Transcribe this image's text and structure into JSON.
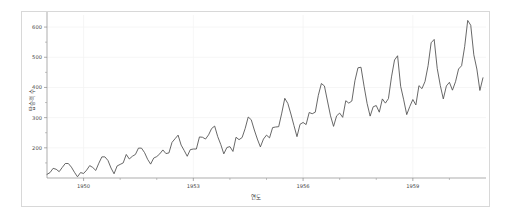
{
  "figure": {
    "background_color": "#ffffff",
    "panel_border_color": "#d8d8d8",
    "axis_color": "#8a8a8a",
    "grid_color": "#f4f4f4"
  },
  "chart_data": {
    "type": "line",
    "title": "",
    "subtitle": "",
    "xlabel": "연도",
    "ylabel": "탑승객 수",
    "line_color": "#4d4d4d",
    "grid": true,
    "legend": false,
    "legend_position": "none",
    "xlim": [
      1949.0,
      1961.0
    ],
    "ylim": [
      100,
      640
    ],
    "x_ticks": [
      1950,
      1953,
      1956,
      1959
    ],
    "x_tick_labels": [
      "1950",
      "1953",
      "1956",
      "1959"
    ],
    "x_minor_ticks": [
      1951,
      1952,
      1954,
      1955,
      1957,
      1958,
      1960
    ],
    "y_ticks": [
      200,
      300,
      400,
      500,
      600
    ],
    "y_tick_labels": [
      "200",
      "300",
      "400",
      "500",
      "600"
    ],
    "y_minor_ticks": [
      150,
      250,
      350,
      450,
      550
    ],
    "series": [
      {
        "name": "AirPassengers",
        "x": [
          1949.0,
          1949.083,
          1949.167,
          1949.25,
          1949.333,
          1949.417,
          1949.5,
          1949.583,
          1949.667,
          1949.75,
          1949.833,
          1949.917,
          1950.0,
          1950.083,
          1950.167,
          1950.25,
          1950.333,
          1950.417,
          1950.5,
          1950.583,
          1950.667,
          1950.75,
          1950.833,
          1950.917,
          1951.0,
          1951.083,
          1951.167,
          1951.25,
          1951.333,
          1951.417,
          1951.5,
          1951.583,
          1951.667,
          1951.75,
          1951.833,
          1951.917,
          1952.0,
          1952.083,
          1952.167,
          1952.25,
          1952.333,
          1952.417,
          1952.5,
          1952.583,
          1952.667,
          1952.75,
          1952.833,
          1952.917,
          1953.0,
          1953.083,
          1953.167,
          1953.25,
          1953.333,
          1953.417,
          1953.5,
          1953.583,
          1953.667,
          1953.75,
          1953.833,
          1953.917,
          1954.0,
          1954.083,
          1954.167,
          1954.25,
          1954.333,
          1954.417,
          1954.5,
          1954.583,
          1954.667,
          1954.75,
          1954.833,
          1954.917,
          1955.0,
          1955.083,
          1955.167,
          1955.25,
          1955.333,
          1955.417,
          1955.5,
          1955.583,
          1955.667,
          1955.75,
          1955.833,
          1955.917,
          1956.0,
          1956.083,
          1956.167,
          1956.25,
          1956.333,
          1956.417,
          1956.5,
          1956.583,
          1956.667,
          1956.75,
          1956.833,
          1956.917,
          1957.0,
          1957.083,
          1957.167,
          1957.25,
          1957.333,
          1957.417,
          1957.5,
          1957.583,
          1957.667,
          1957.75,
          1957.833,
          1957.917,
          1958.0,
          1958.083,
          1958.167,
          1958.25,
          1958.333,
          1958.417,
          1958.5,
          1958.583,
          1958.667,
          1958.75,
          1958.833,
          1958.917,
          1959.0,
          1959.083,
          1959.167,
          1959.25,
          1959.333,
          1959.417,
          1959.5,
          1959.583,
          1959.667,
          1959.75,
          1959.833,
          1959.917,
          1960.0,
          1960.083,
          1960.167,
          1960.25,
          1960.333,
          1960.417,
          1960.5,
          1960.583,
          1960.667,
          1960.75,
          1960.833,
          1960.917
        ],
        "values": [
          112,
          118,
          132,
          129,
          121,
          135,
          148,
          148,
          136,
          119,
          104,
          118,
          115,
          126,
          141,
          135,
          125,
          149,
          170,
          170,
          158,
          133,
          114,
          140,
          145,
          150,
          178,
          163,
          172,
          178,
          199,
          199,
          184,
          162,
          146,
          166,
          171,
          180,
          193,
          181,
          183,
          218,
          230,
          242,
          209,
          191,
          172,
          194,
          196,
          196,
          236,
          235,
          229,
          243,
          264,
          272,
          237,
          211,
          180,
          201,
          204,
          188,
          235,
          227,
          234,
          264,
          302,
          293,
          259,
          229,
          203,
          229,
          242,
          233,
          267,
          269,
          270,
          315,
          364,
          347,
          312,
          274,
          237,
          278,
          284,
          277,
          317,
          313,
          318,
          374,
          413,
          405,
          355,
          306,
          271,
          306,
          315,
          301,
          356,
          348,
          355,
          422,
          465,
          467,
          404,
          347,
          305,
          336,
          340,
          318,
          362,
          348,
          363,
          435,
          491,
          505,
          404,
          359,
          310,
          337,
          360,
          342,
          406,
          396,
          420,
          472,
          548,
          559,
          463,
          407,
          362,
          405,
          417,
          391,
          419,
          461,
          472,
          535,
          622,
          606,
          508,
          461,
          390,
          432
        ]
      }
    ],
    "data_min": 104,
    "data_max": 622,
    "n_points": 144,
    "x_start": 1949.0,
    "x_end": 1960.917
  }
}
